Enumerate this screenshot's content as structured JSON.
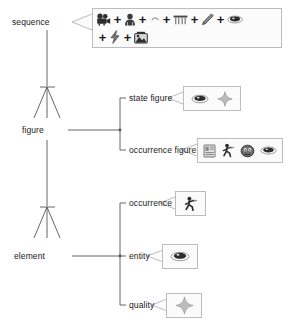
{
  "diagram": {
    "type": "hierarchical-decomposition-tree",
    "title": "",
    "nodes": [
      {
        "id": "sequence",
        "label": "sequence",
        "level": 0
      },
      {
        "id": "figure",
        "label": "figure",
        "level": 1
      },
      {
        "id": "element",
        "label": "element",
        "level": 2
      }
    ],
    "branches": [
      {
        "parent": "figure",
        "label": "state figure"
      },
      {
        "parent": "figure",
        "label": "occurrence figure"
      },
      {
        "parent": "element",
        "label": "occurrence"
      },
      {
        "parent": "element",
        "label": "entity"
      },
      {
        "parent": "element",
        "label": "quality"
      }
    ]
  },
  "labels": {
    "sequence": "sequence",
    "figure": "figure",
    "element": "element",
    "state_figure": "state figure",
    "occurrence_figure": "occurrence figure",
    "occurrence": "occurrence",
    "entity": "entity",
    "quality": "quality"
  },
  "callouts": {
    "sequence_box": {
      "owner": "sequence",
      "rows": [
        [
          "movie-camera-icon",
          "plus-operator",
          "person-icon",
          "plus-operator",
          "small-curve-mark",
          "plus-operator",
          "bench-table-icon",
          "plus-operator",
          "pencil-icon",
          "plus-operator",
          "eye-disc-icon"
        ],
        [
          "plus-operator",
          "lightning-bolt-icon",
          "plus-operator",
          "photo-stack-icon"
        ]
      ],
      "operator_glyph": "+"
    },
    "state_figure_box": {
      "owner": "state figure",
      "icons": [
        "eye-disc-icon",
        "sparkle-star-icon"
      ]
    },
    "occurrence_figure_box": {
      "owner": "occurrence figure",
      "icons": [
        "photo-frame-icon",
        "person-running-icon",
        "face-icon",
        "eye-disc-icon"
      ]
    },
    "occurrence_box": {
      "owner": "occurrence",
      "icons": [
        "person-running-icon"
      ]
    },
    "entity_box": {
      "owner": "entity",
      "icons": [
        "eye-disc-icon"
      ]
    },
    "quality_box": {
      "owner": "quality",
      "icons": [
        "sparkle-star-icon"
      ]
    }
  },
  "colors": {
    "background": "#ffffff",
    "line": "#555555",
    "text": "#1a1a1a",
    "box_border": "#bdbdbd",
    "box_fill": "#fbfbfb",
    "icon_dark": "#333333",
    "icon_grey": "#9a9a9a"
  }
}
